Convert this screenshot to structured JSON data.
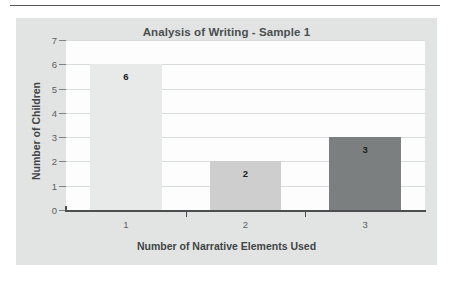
{
  "page": {
    "background_color": "#ffffff",
    "rule_color": "#55595a"
  },
  "chart_panel": {
    "background_color": "#e2e4e4",
    "plot_background_color": "#fdfdfd",
    "gridline_color": "#d9dcdc",
    "axis_color": "#4b4f50"
  },
  "chart_data": {
    "type": "bar",
    "title": "Analysis of Writing - Sample 1",
    "xlabel": "Number of Narrative Elements Used",
    "ylabel": "Number of Children",
    "categories": [
      "1",
      "2",
      "3"
    ],
    "values": [
      6,
      2,
      3
    ],
    "data_labels": [
      "6",
      "2",
      "3"
    ],
    "bar_colors": [
      "#e8e9e9",
      "#cdcecd",
      "#7c7f7f"
    ],
    "ylim": [
      0,
      7
    ],
    "yticks": [
      0,
      1,
      2,
      3,
      4,
      5,
      6,
      7
    ],
    "ytick_labels": [
      "0",
      "1",
      "2",
      "3",
      "4",
      "5",
      "6",
      "7"
    ],
    "grid": true,
    "legend": false,
    "legend_position": "none"
  }
}
